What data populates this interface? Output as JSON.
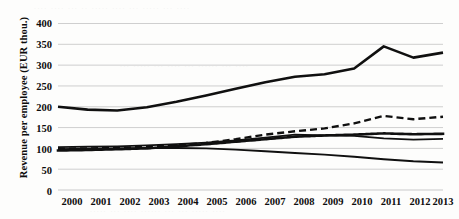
{
  "chart_data": {
    "type": "line",
    "title": "",
    "xlabel": "",
    "ylabel": "Revenue per employee (EUR thou.)",
    "categories": [
      "2000",
      "2001",
      "2002",
      "2003",
      "2004",
      "2005",
      "2006",
      "2007",
      "2008",
      "2009",
      "2010",
      "2011",
      "2012",
      "2013"
    ],
    "ylim": [
      0,
      400
    ],
    "ytick_values": [
      "0",
      "50",
      "100",
      "150",
      "200",
      "250",
      "300",
      "350",
      "400"
    ],
    "grid": true,
    "legend": "none",
    "series": [
      {
        "name": "series-1-solid-thick",
        "style": "solid",
        "width": 2.6,
        "color": "#101010",
        "values": [
          200,
          193,
          191,
          199,
          212,
          227,
          243,
          259,
          272,
          278,
          292,
          345,
          318,
          330
        ]
      },
      {
        "name": "series-2-dashed",
        "style": "dashed",
        "width": 2.4,
        "color": "#101010",
        "values": [
          99,
          100,
          101,
          104,
          108,
          113,
          122,
          133,
          141,
          148,
          160,
          178,
          170,
          176
        ]
      },
      {
        "name": "series-3-dotted",
        "style": "dotted",
        "width": 2.6,
        "color": "#101010",
        "values": [
          95,
          96,
          98,
          100,
          105,
          110,
          116,
          122,
          128,
          131,
          133,
          136,
          134,
          135
        ]
      },
      {
        "name": "series-4-solid-thin",
        "style": "solid",
        "width": 1.7,
        "color": "#101010",
        "values": [
          103,
          104,
          105,
          107,
          110,
          114,
          119,
          126,
          133,
          131,
          130,
          124,
          121,
          123
        ]
      },
      {
        "name": "series-5-solid-declining",
        "style": "solid",
        "width": 1.9,
        "color": "#101010",
        "values": [
          98,
          99,
          100,
          101,
          101,
          100,
          97,
          93,
          89,
          85,
          80,
          74,
          69,
          66
        ]
      }
    ]
  },
  "figure": {
    "background_color": "#fdfdfc",
    "ink_color": "#101010",
    "gridline_color": "#c9c9c9"
  }
}
